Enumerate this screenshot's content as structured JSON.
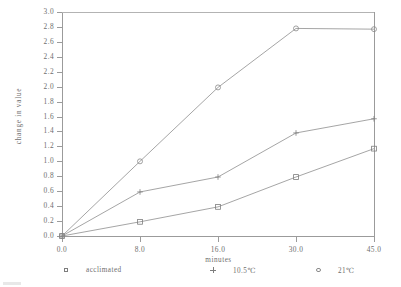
{
  "chart_data": {
    "type": "line",
    "title": "",
    "subtitle": "",
    "xlabel": "minutes",
    "ylabel": "change in value",
    "categories": [
      "0.0",
      "8.0",
      "16.0",
      "30.0",
      "45.0"
    ],
    "x": [
      0.0,
      8.0,
      16.0,
      30.0,
      45.0
    ],
    "x_axis_spacing": "categorical-equal",
    "ylim": [
      0.0,
      3.0
    ],
    "ytick_step": 0.2,
    "yticks": [
      "0.0",
      "0.2",
      "0.4",
      "0.6",
      "0.8",
      "1.0",
      "1.2",
      "1.4",
      "1.6",
      "1.8",
      "2.0",
      "2.2",
      "2.4",
      "2.6",
      "2.8",
      "3.0"
    ],
    "xticks": [
      "0.0",
      "8.0",
      "16.0",
      "30.0",
      "45.0"
    ],
    "grid": false,
    "legend_position": "below-axes",
    "series": [
      {
        "name": "acclimated",
        "marker": "square",
        "color": "#7d7d7d",
        "values": [
          0.0,
          0.19,
          0.39,
          0.79,
          1.17
        ]
      },
      {
        "name": "10.5℃",
        "marker": "plus",
        "color": "#7d7d7d",
        "values": [
          0.0,
          0.59,
          0.79,
          1.38,
          1.57
        ]
      },
      {
        "name": "21℃",
        "marker": "circle",
        "color": "#8a8a8a",
        "values": [
          0.0,
          1.0,
          1.99,
          2.78,
          2.77
        ]
      }
    ]
  },
  "legend": {
    "entries": [
      {
        "label": "acclimated",
        "marker": "square"
      },
      {
        "label": "10.5℃",
        "marker": "plus"
      },
      {
        "label": "21℃",
        "marker": "circle"
      }
    ]
  },
  "colors": {
    "background": "#ffffff",
    "axis": "#9b9b9b",
    "text": "#6e6e6e",
    "series_line": "#8e8e8e"
  }
}
